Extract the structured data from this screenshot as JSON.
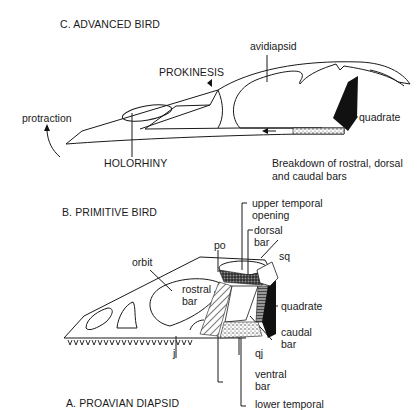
{
  "figure": {
    "panels": [
      {
        "id": "C",
        "title": "C. ADVANCED BIRD",
        "labels": {
          "avidiapsid": "avidiapsid",
          "prokinesis": "PROKINESIS",
          "protraction": "protraction",
          "quadrate": "quadrate",
          "holorhiny": "HOLORHINY",
          "breakdown_line1": "Breakdown of rostral, dorsal",
          "breakdown_line2": "and caudal bars"
        }
      },
      {
        "id": "B",
        "title": "B. PRIMITIVE BIRD",
        "labels": {
          "upper_temporal_line1": "upper temporal",
          "upper_temporal_line2": "opening",
          "dorsal_line1": "dorsal",
          "dorsal_line2": "bar",
          "po": "po",
          "sq": "sq",
          "orbit": "orbit",
          "rostral_line1": "rostral",
          "rostral_line2": "bar",
          "quadrate": "quadrate",
          "caudal_line1": "caudal",
          "caudal_line2": "bar",
          "j": "j",
          "qj": "qj",
          "ventral_line1": "ventral",
          "ventral_line2": "bar",
          "lower_temporal": "lower temporal"
        }
      },
      {
        "id": "A",
        "title": "A. PROAVIAN DIAPSID"
      }
    ],
    "colors": {
      "line": "#1a1a1a",
      "fill_black": "#111111",
      "background": "#ffffff"
    }
  }
}
